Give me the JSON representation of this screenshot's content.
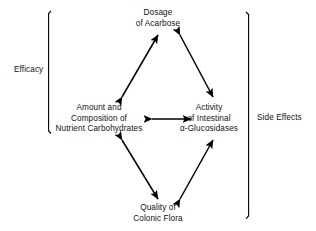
{
  "diagram": {
    "background_color": "#ffffff",
    "line_color": "#000000",
    "text_color": "#111111",
    "nodes": [
      {
        "id": "dosage",
        "lines": [
          "Dosage",
          "of Acarbose"
        ],
        "position": "top"
      },
      {
        "id": "carbohydrates",
        "lines": [
          "Amount and",
          "Composition of",
          "Nutrient Carbohydrates"
        ],
        "position": "left"
      },
      {
        "id": "glucosidases",
        "lines": [
          "Activity",
          "of Intestinal",
          "α-Glucosidases"
        ],
        "position": "right"
      },
      {
        "id": "flora",
        "lines": [
          "Quality of",
          "Colonic Flora"
        ],
        "position": "bottom"
      }
    ],
    "connectors": [
      {
        "id": "dosage-carbohydrates",
        "from": "carbohydrates",
        "to": "dosage",
        "style": "double-headed-arrow"
      },
      {
        "id": "dosage-glucosidases",
        "from": "dosage",
        "to": "glucosidases",
        "style": "double-headed-arrow"
      },
      {
        "id": "carbohydrates-glucosidases",
        "from": "carbohydrates",
        "to": "glucosidases",
        "style": "double-headed-arrow"
      },
      {
        "id": "carbohydrates-flora",
        "from": "carbohydrates",
        "to": "flora",
        "style": "double-headed-arrow"
      },
      {
        "id": "glucosidases-flora",
        "from": "glucosidases",
        "to": "flora",
        "style": "double-headed-arrow"
      }
    ],
    "brackets": [
      {
        "id": "efficacy",
        "label": "Efficacy",
        "side": "left"
      },
      {
        "id": "side-effects",
        "label": "Side Effects",
        "side": "right"
      }
    ]
  }
}
